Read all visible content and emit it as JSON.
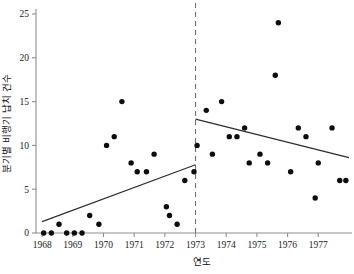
{
  "chart_data": {
    "type": "scatter",
    "title": "",
    "xlabel": "연도",
    "ylabel": "분기별 비행기 납치 건수",
    "xlim": [
      1967.8,
      1978.1
    ],
    "ylim": [
      0,
      25
    ],
    "x_ticks": [
      1968,
      1969,
      1970,
      1971,
      1972,
      1973,
      1974,
      1975,
      1976,
      1977
    ],
    "x_tick_labels": [
      "1968",
      "1969",
      "1970",
      "1971",
      "1972",
      "1973",
      "1974",
      "1975",
      "1976",
      "1977"
    ],
    "y_ticks": [
      0,
      5,
      10,
      15,
      20,
      25
    ],
    "y_tick_labels": [
      "0",
      "5",
      "10",
      "15",
      "20",
      "25"
    ],
    "grid": false,
    "legend": false,
    "point_color": "#0d0d0d",
    "line_color": "#2d2d2d",
    "divider_color": "#6f6f6f",
    "axis_color": "#8d8d8d",
    "points": [
      {
        "x": 1968.05,
        "y": 0
      },
      {
        "x": 1968.3,
        "y": 0
      },
      {
        "x": 1968.55,
        "y": 1
      },
      {
        "x": 1968.8,
        "y": 0
      },
      {
        "x": 1969.05,
        "y": 0
      },
      {
        "x": 1969.3,
        "y": 0
      },
      {
        "x": 1969.55,
        "y": 2
      },
      {
        "x": 1969.85,
        "y": 1
      },
      {
        "x": 1970.1,
        "y": 10
      },
      {
        "x": 1970.35,
        "y": 11
      },
      {
        "x": 1970.6,
        "y": 15
      },
      {
        "x": 1970.9,
        "y": 8
      },
      {
        "x": 1971.1,
        "y": 7
      },
      {
        "x": 1971.4,
        "y": 7
      },
      {
        "x": 1971.65,
        "y": 9
      },
      {
        "x": 1972.05,
        "y": 3
      },
      {
        "x": 1972.15,
        "y": 2
      },
      {
        "x": 1972.4,
        "y": 1
      },
      {
        "x": 1972.65,
        "y": 6
      },
      {
        "x": 1972.95,
        "y": 7
      },
      {
        "x": 1973.05,
        "y": 10
      },
      {
        "x": 1973.35,
        "y": 14
      },
      {
        "x": 1973.55,
        "y": 9
      },
      {
        "x": 1973.85,
        "y": 15
      },
      {
        "x": 1974.1,
        "y": 11
      },
      {
        "x": 1974.35,
        "y": 11
      },
      {
        "x": 1974.6,
        "y": 12
      },
      {
        "x": 1974.75,
        "y": 8
      },
      {
        "x": 1975.1,
        "y": 9
      },
      {
        "x": 1975.35,
        "y": 8
      },
      {
        "x": 1975.6,
        "y": 18
      },
      {
        "x": 1975.7,
        "y": 24
      },
      {
        "x": 1976.1,
        "y": 7
      },
      {
        "x": 1976.35,
        "y": 12
      },
      {
        "x": 1976.6,
        "y": 11
      },
      {
        "x": 1976.9,
        "y": 4
      },
      {
        "x": 1977.0,
        "y": 8
      },
      {
        "x": 1977.45,
        "y": 12
      },
      {
        "x": 1977.7,
        "y": 6
      },
      {
        "x": 1977.9,
        "y": 6
      }
    ],
    "trend_lines": [
      {
        "name": "pre-intervention-trend",
        "x_start": 1968.0,
        "y_start": 1.3,
        "x_end": 1973.0,
        "y_end": 7.8
      },
      {
        "name": "post-intervention-trend",
        "x_start": 1973.0,
        "y_start": 13.0,
        "x_end": 1978.0,
        "y_end": 8.6
      }
    ],
    "divider": {
      "name": "intervention-line",
      "x": 1973.0,
      "style": "dashed"
    }
  }
}
